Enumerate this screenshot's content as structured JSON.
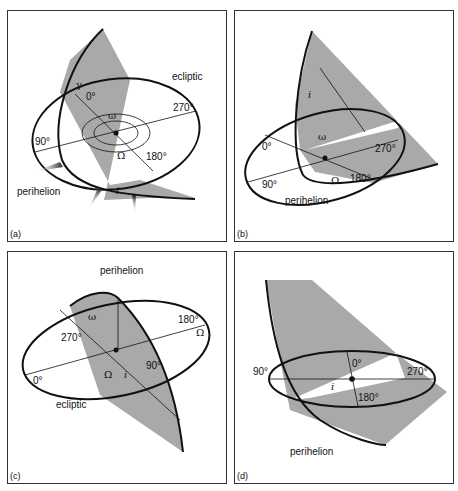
{
  "figure": {
    "panels": [
      {
        "id": "a",
        "label": "(a)",
        "texts": {
          "ecliptic": "ecliptic",
          "deg0": "0°",
          "deg90": "90°",
          "deg180": "180°",
          "deg270": "270°",
          "perihelion": "perihelion",
          "gamma": "γ",
          "omega": "ω",
          "Omega": "Ω",
          "i": "i"
        }
      },
      {
        "id": "b",
        "label": "(b)",
        "texts": {
          "deg0": "0°",
          "deg90": "90°",
          "deg180": "180°",
          "deg270": "270°",
          "perihelion": "perihelion",
          "omega": "ω",
          "Omega": "Ω",
          "i": "i"
        }
      },
      {
        "id": "c",
        "label": "(c)",
        "texts": {
          "ecliptic": "ecliptic",
          "deg0": "0°",
          "deg90": "90°",
          "deg180": "180°",
          "deg270": "270°",
          "perihelion": "perihelion",
          "omega": "ω",
          "Omega": "Ω",
          "Omega2": "Ω",
          "i": "i"
        }
      },
      {
        "id": "d",
        "label": "(d)",
        "texts": {
          "deg0": "0°",
          "deg90": "90°",
          "deg180": "180°",
          "deg270": "270°",
          "perihelion": "perihelion",
          "i": "i"
        }
      }
    ],
    "colors": {
      "plane": "#a9a9a9",
      "line": "#111111",
      "border": "#333333",
      "background": "#ffffff"
    }
  }
}
